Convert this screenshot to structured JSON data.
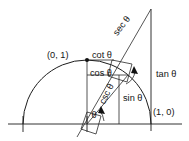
{
  "figure": {
    "type": "geometry-diagram",
    "background_color": "#ffffff",
    "line_color": "#1c1c1c",
    "text_color": "#141414"
  },
  "labels": {
    "point_top": "(0, 1)",
    "point_right": "(1, 0)",
    "cot": "cot θ",
    "cos": "cos θ",
    "tan": "tan θ",
    "sin": "sin θ",
    "sec": "sec θ",
    "csc": "csc θ",
    "theta_origin": "θ",
    "theta_tangent": "θ"
  },
  "geometry": {
    "origin": {
      "x": 87,
      "y": 124
    },
    "radius": 64,
    "angle_degrees": 50,
    "unit_point_top": {
      "x": 87,
      "y": 60
    },
    "unit_point_right": {
      "x": 151,
      "y": 124
    },
    "circle_point": {
      "x": 128,
      "y": 75
    },
    "tangent_apex": {
      "x": 151,
      "y": 9
    },
    "cot_intersection": {
      "x": 112,
      "y": 60
    },
    "csc_extension_end": {
      "x": 77,
      "y": 137
    },
    "axis_left_end": {
      "x": 8,
      "y": 124
    },
    "axis_right_end": {
      "x": 182,
      "y": 124
    },
    "tick_left": {
      "x": 23,
      "y": 124
    },
    "arc_start_angle": 180,
    "arc_end_angle": 0
  },
  "label_positions": {
    "point_top": {
      "x": 47,
      "y": 56,
      "rotation": 0
    },
    "cot": {
      "x": 92,
      "y": 56,
      "rotation": 0
    },
    "cos": {
      "x": 90,
      "y": 74,
      "rotation": 0
    },
    "tan": {
      "x": 156,
      "y": 75,
      "rotation": 0
    },
    "sin": {
      "x": 123,
      "y": 99,
      "rotation": 0
    },
    "sec": {
      "x": 122,
      "y": 26,
      "rotation": -52
    },
    "csc": {
      "x": 107,
      "y": 94,
      "rotation": -64
    },
    "point_right": {
      "x": 153,
      "y": 113,
      "rotation": 0
    },
    "theta_origin": {
      "x": 94,
      "y": 116,
      "rotation": 0
    },
    "theta_tangent": {
      "x": 131,
      "y": 68,
      "rotation": 0
    }
  }
}
